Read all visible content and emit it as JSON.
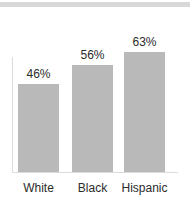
{
  "chart_data": {
    "type": "bar",
    "title": "",
    "subtitle": "",
    "xlabel": "",
    "ylabel": "",
    "categories": [
      "White",
      "Black",
      "Hispanic"
    ],
    "values": [
      46,
      56,
      63
    ],
    "value_labels": [
      "46%",
      "56%",
      "63%"
    ],
    "ylim": [
      0,
      73
    ],
    "grid": false,
    "legend": null,
    "legend_position": "none",
    "annotations": [],
    "bar_color": "#b9b9b9",
    "text_color": "#2b2b2b",
    "axis_color": "#dcdcdc",
    "background_color": "#ffffff",
    "top_band_color": "#d8d8d8"
  }
}
